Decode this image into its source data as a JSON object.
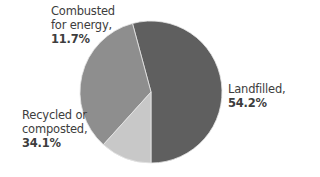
{
  "chart_data": {
    "type": "pie",
    "title": "",
    "categories": [
      "Landfilled",
      "Recycled or composted",
      "Combusted for energy"
    ],
    "values": [
      54.2,
      34.1,
      11.7
    ],
    "unit": "%",
    "colors": [
      "#5f5f5f",
      "#8e8e8e",
      "#c8c8c8"
    ],
    "start_angle_deg": 180,
    "direction": "counterclockwise-from-bottom",
    "legend": "none (direct labels)",
    "labels": [
      {
        "line1": "Landfilled,",
        "line2": "",
        "value": "54.2%"
      },
      {
        "line1": "Recycled or",
        "line2": "composted,",
        "value": "34.1%"
      },
      {
        "line1": "Combusted",
        "line2": "for energy,",
        "value": "11.7%"
      }
    ]
  }
}
